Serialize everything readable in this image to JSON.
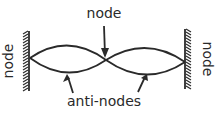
{
  "diagram": {
    "type": "standing-wave",
    "labels": {
      "center_node": "node",
      "left_node": "node",
      "right_node": "node",
      "antinodes": "anti-nodes"
    },
    "color": "#2a2a2a"
  }
}
